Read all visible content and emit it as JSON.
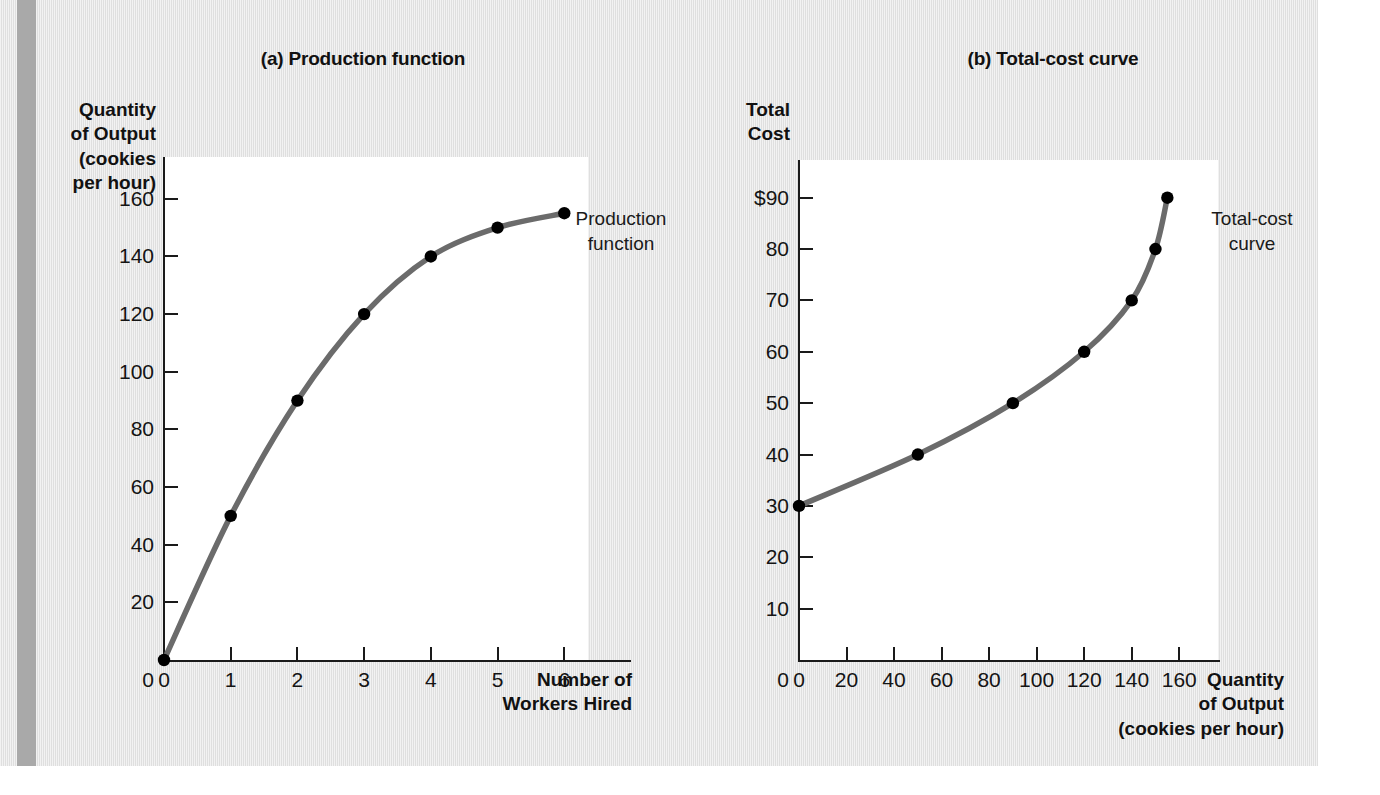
{
  "figure": {
    "background_color": "#e3e3e3",
    "curve_color": "#6b6b6b",
    "point_color": "#000000",
    "axis_color": "#1a1a1a"
  },
  "panel_a": {
    "title": "(a) Production function",
    "y_axis_caption": "Quantity\nof Output\n(cookies\nper hour)",
    "x_axis_caption": "Number of\nWorkers Hired",
    "curve_label": "Production\nfunction",
    "y_ticks": [
      "160",
      "140",
      "120",
      "100",
      "80",
      "60",
      "40",
      "20",
      "0"
    ],
    "x_ticks": [
      "0",
      "1",
      "2",
      "3",
      "4",
      "5",
      "6"
    ]
  },
  "panel_b": {
    "title": "(b) Total-cost curve",
    "y_axis_caption": "Total\nCost",
    "x_axis_caption": "Quantity\nof Output\n(cookies per hour)",
    "curve_label": "Total-cost\ncurve",
    "y_ticks": [
      "$90",
      "80",
      "70",
      "60",
      "50",
      "40",
      "30",
      "20",
      "10",
      "0"
    ],
    "x_ticks": [
      "0",
      "20",
      "40",
      "60",
      "80",
      "100",
      "120",
      "140",
      "160"
    ]
  },
  "chart_data": [
    {
      "type": "line",
      "title": "(a) Production function",
      "xlabel": "Number of Workers Hired",
      "ylabel": "Quantity of Output (cookies per hour)",
      "xlim": [
        0,
        7
      ],
      "ylim": [
        0,
        170
      ],
      "x_ticks": [
        0,
        1,
        2,
        3,
        4,
        5,
        6
      ],
      "y_ticks": [
        0,
        20,
        40,
        60,
        80,
        100,
        120,
        140,
        160
      ],
      "grid": false,
      "legend": "annotation",
      "annotations": [
        {
          "text": "Production function",
          "x": 6,
          "y": 155
        }
      ],
      "series": [
        {
          "name": "Production function",
          "x": [
            0,
            1,
            2,
            3,
            4,
            5,
            6
          ],
          "values": [
            0,
            50,
            90,
            120,
            140,
            150,
            155
          ],
          "markers": true
        }
      ]
    },
    {
      "type": "line",
      "title": "(b) Total-cost curve",
      "xlabel": "Quantity of Output (cookies per hour)",
      "ylabel": "Total Cost",
      "xlim": [
        0,
        170
      ],
      "ylim": [
        0,
        95
      ],
      "x_ticks": [
        0,
        20,
        40,
        60,
        80,
        100,
        120,
        140,
        160
      ],
      "y_ticks": [
        0,
        10,
        20,
        30,
        40,
        50,
        60,
        70,
        80,
        90
      ],
      "grid": false,
      "legend": "annotation",
      "annotations": [
        {
          "text": "Total-cost curve",
          "x": 155,
          "y": 80
        }
      ],
      "series": [
        {
          "name": "Total-cost curve",
          "x": [
            0,
            50,
            90,
            120,
            140,
            150,
            155
          ],
          "values": [
            30,
            40,
            50,
            60,
            70,
            80,
            90
          ],
          "markers": true
        }
      ]
    }
  ]
}
